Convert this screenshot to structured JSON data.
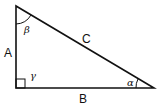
{
  "diagram": {
    "sides": {
      "a": "A",
      "b": "B",
      "c": "C"
    },
    "angles": {
      "alpha": "α",
      "beta": "β",
      "gamma": "γ"
    },
    "colors": {
      "stroke": "#111111",
      "background": "#ffffff"
    }
  }
}
